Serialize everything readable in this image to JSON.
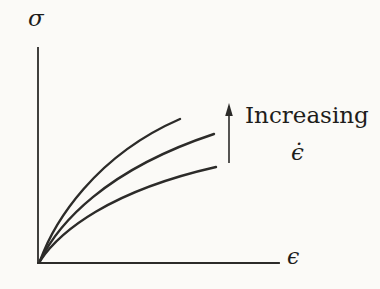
{
  "colors": {
    "ink": "#2c2b29",
    "text": "#1e1d1b",
    "background": "#fbfaf7"
  },
  "annotation": {
    "label": "Increasing",
    "symbol": "ϵ̇"
  },
  "chart_data": {
    "type": "line",
    "title": "",
    "xlabel": "ϵ",
    "ylabel": "σ",
    "axis_numeric_labels": "none (qualitative sketch)",
    "series": [
      {
        "name": "highest strain rate (top curve)",
        "path": "M 40,261 C 54,222 95,156 180,119"
      },
      {
        "name": "middle strain rate (middle curve)",
        "path": "M 40,261 C 58,224 105,170 214,134"
      },
      {
        "name": "lowest strain rate (bottom curve)",
        "path": "M 40,261 C 60,231 110,191 216,167"
      }
    ]
  },
  "geometry": {
    "y_axis_path": "M 38,48 L 38,263",
    "x_axis_path": "M 38,263 L 279,263",
    "arrow_shaft_path": "M 229,163 L 229,113",
    "arrow_head_points": "229,103 225.2,116 232.8,116"
  }
}
